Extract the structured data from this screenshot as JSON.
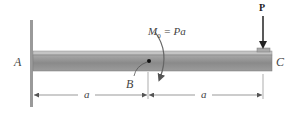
{
  "diagram": {
    "type": "cantilever-beam",
    "labels": {
      "support": "A",
      "midpoint": "B",
      "free_end": "C",
      "load": "P",
      "moment_symbol": "M",
      "moment_subscript": "0",
      "moment_equation": "= Pa",
      "span_left": "a",
      "span_right": "a"
    },
    "colors": {
      "beam_body": "#8c8c8c",
      "beam_top": "#bdbdbd",
      "wall": "#9a9a9a",
      "arrow": "#222222",
      "dimension": "#555555"
    }
  }
}
